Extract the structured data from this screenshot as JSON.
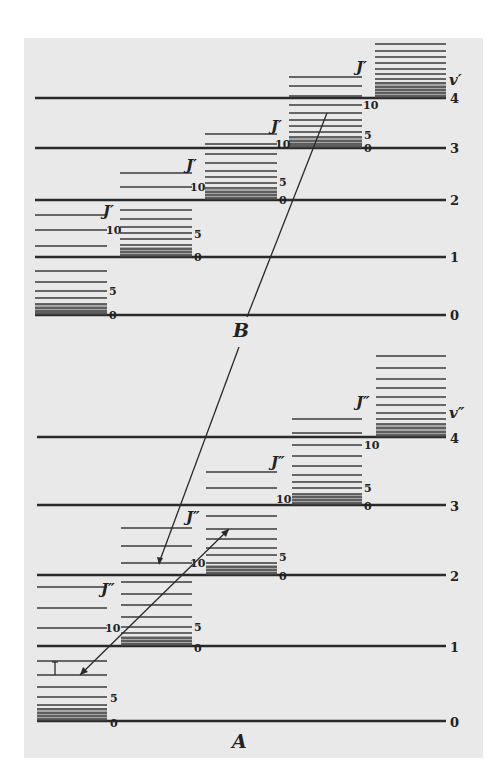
{
  "diagram": {
    "upper_state": {
      "electronic_label": "B",
      "vib_quantum_label": "v'",
      "rot_quantum_label": "J'",
      "vibrational_levels": [
        {
          "v": "0",
          "y": 315
        },
        {
          "v": "1",
          "y": 257
        },
        {
          "v": "2",
          "y": 200
        },
        {
          "v": "3",
          "y": 148
        },
        {
          "v": "4",
          "y": 98
        }
      ],
      "rotational_tick_labels": [
        "0",
        "5",
        "10"
      ]
    },
    "lower_state": {
      "electronic_label": "A",
      "vib_quantum_label": "v''",
      "rot_quantum_label": "J''",
      "vibrational_levels": [
        {
          "v": "0",
          "y": 721
        },
        {
          "v": "1",
          "y": 646
        },
        {
          "v": "2",
          "y": 575
        },
        {
          "v": "3",
          "y": 505
        },
        {
          "v": "4",
          "y": 437
        }
      ],
      "rotational_tick_labels": [
        "0",
        "5",
        "10"
      ]
    },
    "labels": {
      "B": "B",
      "A": "A",
      "v_prime": "v′",
      "v_dprime": "v″",
      "J_prime": "J′",
      "J_dprime": "J″",
      "zero": "0",
      "five": "5",
      "ten": "10",
      "one": "1",
      "two": "2",
      "three": "3",
      "four": "4"
    },
    "transitions": [
      {
        "name": "emission",
        "from": "v'=3 J'≈12",
        "to": "v''=2 J''=10"
      },
      {
        "name": "absorption",
        "from": "v''=0 J''≈8",
        "to": "v''=2 J''≈14"
      },
      {
        "name": "small-step",
        "from": "v''=0 J''≈8",
        "to": "v''=0 J''≈9"
      }
    ]
  }
}
